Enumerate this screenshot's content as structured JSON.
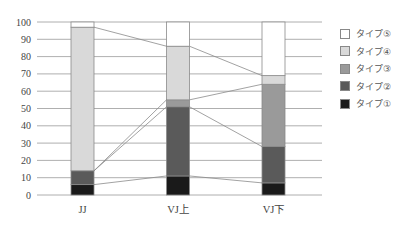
{
  "chart_data": {
    "type": "bar",
    "stacked": true,
    "title": "",
    "xlabel": "",
    "ylabel": "",
    "ylim": [
      0,
      100
    ],
    "yticks": [
      0,
      10,
      20,
      30,
      40,
      50,
      60,
      70,
      80,
      90,
      100
    ],
    "grid": true,
    "legend_position": "right",
    "categories": [
      "JJ",
      "VJ上",
      "VJ下"
    ],
    "series": [
      {
        "name": "タイプ①",
        "color": "#1a1a1a",
        "values": [
          6,
          11,
          7
        ]
      },
      {
        "name": "タイプ②",
        "color": "#5a5a5a",
        "values": [
          8,
          40,
          21
        ]
      },
      {
        "name": "タイプ③",
        "color": "#9a9a9a",
        "values": [
          0,
          4,
          36
        ]
      },
      {
        "name": "タイプ④",
        "color": "#d9d9d9",
        "values": [
          83,
          31,
          5
        ]
      },
      {
        "name": "タイプ⑤",
        "color": "#ffffff",
        "values": [
          3,
          14,
          31
        ]
      }
    ],
    "connector_lines": true
  },
  "legend": {
    "items": [
      {
        "label": "タイプ⑤",
        "color": "#ffffff"
      },
      {
        "label": "タイプ④",
        "color": "#d9d9d9"
      },
      {
        "label": "タイプ③",
        "color": "#9a9a9a"
      },
      {
        "label": "タイプ②",
        "color": "#5a5a5a"
      },
      {
        "label": "タイプ①",
        "color": "#1a1a1a"
      }
    ]
  }
}
